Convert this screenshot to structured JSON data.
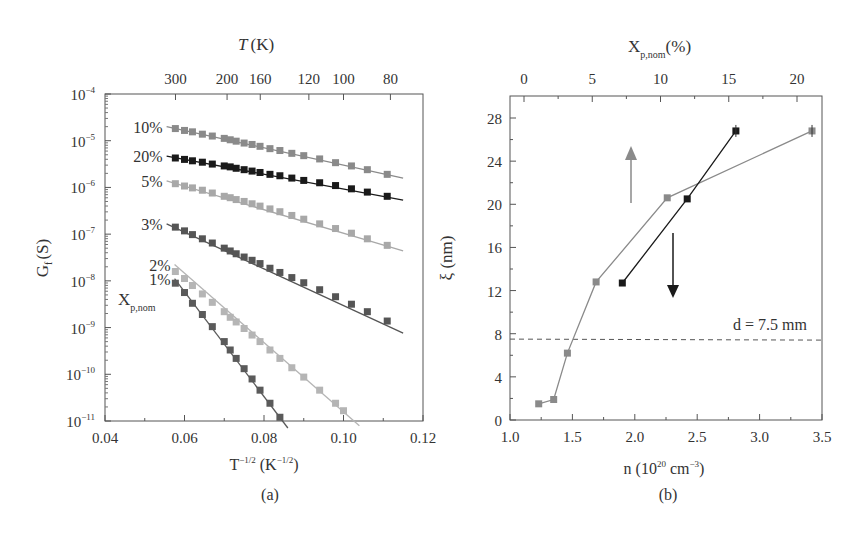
{
  "chart_data": [
    {
      "id": "a",
      "type": "scatter",
      "panel_label": "(a)",
      "title": "",
      "xlabel": "T^-1/2 (K^-1/2)",
      "ylabel": "Gf (S)",
      "top_axis_label": "T (K)",
      "top_axis_ticks": [
        300,
        200,
        160,
        120,
        100,
        80
      ],
      "xlim": [
        0.04,
        0.12
      ],
      "ylim_log10": [
        -11,
        -4
      ],
      "x_ticks": [
        "0.04",
        "0.06",
        "0.08",
        "0.10",
        "0.12"
      ],
      "y_ticks": [
        "10^-4",
        "10^-5",
        "10^-6",
        "10^-7",
        "10^-8",
        "10^-9",
        "10^-10",
        "10^-11"
      ],
      "yscale": "log",
      "grid": false,
      "legend_title": "Xp,nom",
      "series": [
        {
          "name": "10%",
          "color": "#8a8a8a",
          "x": [
            0.0577,
            0.06,
            0.062,
            0.0645,
            0.067,
            0.07,
            0.0715,
            0.073,
            0.075,
            0.077,
            0.079,
            0.0815,
            0.084,
            0.087,
            0.09,
            0.094,
            0.098,
            0.102,
            0.106,
            0.111
          ],
          "log10_y": [
            -4.74,
            -4.78,
            -4.81,
            -4.86,
            -4.9,
            -4.95,
            -4.98,
            -5.01,
            -5.05,
            -5.08,
            -5.12,
            -5.17,
            -5.21,
            -5.27,
            -5.32,
            -5.39,
            -5.47,
            -5.54,
            -5.62,
            -5.72
          ],
          "fit_x": [
            0.0555,
            0.115
          ],
          "fit_log10_y": [
            -4.7,
            -5.8
          ]
        },
        {
          "name": "20%",
          "color": "#1a1a1a",
          "x": [
            0.0577,
            0.06,
            0.062,
            0.0645,
            0.067,
            0.07,
            0.0715,
            0.073,
            0.075,
            0.077,
            0.079,
            0.0815,
            0.084,
            0.087,
            0.09,
            0.094,
            0.098,
            0.102,
            0.106,
            0.111
          ],
          "log10_y": [
            -5.37,
            -5.4,
            -5.43,
            -5.46,
            -5.5,
            -5.54,
            -5.56,
            -5.59,
            -5.62,
            -5.65,
            -5.68,
            -5.72,
            -5.75,
            -5.8,
            -5.85,
            -5.9,
            -5.96,
            -6.03,
            -6.1,
            -6.19
          ],
          "fit_x": [
            0.0555,
            0.115
          ],
          "fit_log10_y": [
            -5.33,
            -6.27
          ]
        },
        {
          "name": "5%",
          "color": "#a8a8a8",
          "x": [
            0.0577,
            0.06,
            0.062,
            0.0645,
            0.067,
            0.07,
            0.0715,
            0.073,
            0.075,
            0.077,
            0.079,
            0.0815,
            0.084,
            0.087,
            0.09,
            0.094,
            0.098,
            0.102,
            0.106,
            0.111
          ],
          "log10_y": [
            -5.92,
            -5.97,
            -6.01,
            -6.06,
            -6.12,
            -6.19,
            -6.22,
            -6.26,
            -6.3,
            -6.35,
            -6.4,
            -6.46,
            -6.52,
            -6.6,
            -6.68,
            -6.78,
            -6.88,
            -6.98,
            -7.1,
            -7.24
          ],
          "fit_x": [
            0.0555,
            0.115
          ],
          "fit_log10_y": [
            -5.86,
            -7.36
          ]
        },
        {
          "name": "3%",
          "color": "#555555",
          "x": [
            0.0577,
            0.06,
            0.062,
            0.0645,
            0.067,
            0.07,
            0.0715,
            0.073,
            0.075,
            0.077,
            0.079,
            0.0815,
            0.084,
            0.087,
            0.09,
            0.094,
            0.098,
            0.102,
            0.106,
            0.111
          ],
          "log10_y": [
            -6.85,
            -6.93,
            -7.01,
            -7.1,
            -7.19,
            -7.3,
            -7.36,
            -7.42,
            -7.49,
            -7.56,
            -7.63,
            -7.73,
            -7.82,
            -7.93,
            -8.04,
            -8.19,
            -8.34,
            -8.5,
            -8.66,
            -8.86
          ],
          "fit_x": [
            0.0555,
            0.115
          ],
          "fit_log10_y": [
            -6.78,
            -9.12
          ]
        },
        {
          "name": "2%",
          "color": "#b5b5b5",
          "x": [
            0.0577,
            0.06,
            0.062,
            0.0645,
            0.067,
            0.07,
            0.0715,
            0.073,
            0.075,
            0.077,
            0.079,
            0.0815,
            0.084,
            0.087,
            0.09,
            0.094,
            0.098,
            0.1
          ],
          "log10_y": [
            -7.8,
            -7.95,
            -8.1,
            -8.28,
            -8.46,
            -8.66,
            -8.78,
            -8.88,
            -9.02,
            -9.16,
            -9.3,
            -9.48,
            -9.66,
            -9.86,
            -10.06,
            -10.34,
            -10.62,
            -10.78
          ],
          "fit_x": [
            0.0575,
            0.104
          ],
          "fit_log10_y": [
            -7.65,
            -11.1
          ]
        },
        {
          "name": "1%",
          "color": "#5a5a5a",
          "x": [
            0.0577,
            0.06,
            0.062,
            0.0645,
            0.067,
            0.07,
            0.0715,
            0.073,
            0.075,
            0.077,
            0.079,
            0.0815,
            0.084
          ],
          "log10_y": [
            -8.05,
            -8.25,
            -8.48,
            -8.72,
            -8.98,
            -9.3,
            -9.48,
            -9.66,
            -9.88,
            -10.1,
            -10.34,
            -10.62,
            -10.92
          ],
          "fit_x": [
            0.0575,
            0.086
          ],
          "fit_log10_y": [
            -7.95,
            -11.15
          ]
        }
      ]
    },
    {
      "id": "b",
      "type": "line",
      "panel_label": "(b)",
      "title": "",
      "xlabel": "n (10^20 cm^-3)",
      "ylabel": "ξ (nm)",
      "top_axis_label": "Xp,nom(%)",
      "top_axis_ticks": [
        "0",
        "5",
        "10",
        "15",
        "20"
      ],
      "xlim": [
        1.0,
        3.5
      ],
      "ylim": [
        0,
        30
      ],
      "x_ticks": [
        "1.0",
        "1.5",
        "2.0",
        "2.5",
        "3.0",
        "3.5"
      ],
      "y_ticks": [
        "0",
        "4",
        "8",
        "12",
        "16",
        "20",
        "24",
        "28"
      ],
      "grid": false,
      "annotations": [
        {
          "text": "d = 7.5 mm",
          "type": "hline",
          "y": 7.5,
          "style": "dashed"
        },
        {
          "type": "arrow",
          "direction": "up",
          "color": "#8a8a8a"
        },
        {
          "type": "arrow",
          "direction": "down",
          "color": "#1a1a1a"
        }
      ],
      "series": [
        {
          "name": "gray (bottom axis, n)",
          "color": "#8a8a8a",
          "x": [
            1.23,
            1.35,
            1.46,
            1.69,
            2.26,
            3.42
          ],
          "y": [
            1.5,
            1.9,
            6.2,
            12.8,
            20.6,
            26.8
          ]
        },
        {
          "name": "black (top axis, Xp,nom)",
          "color": "#1a1a1a",
          "x": [
            1.9,
            2.42,
            2.81
          ],
          "y": [
            12.7,
            20.5,
            26.8
          ],
          "top_x_percent": [
            7.5,
            12,
            15
          ]
        }
      ]
    }
  ],
  "labels": {
    "a_ylabel": "G",
    "a_ylabel_sub": "f",
    "a_ylabel_unit": "(S)",
    "a_top_T": "T",
    "a_top_unit": "(K)",
    "a_xlabel_main": "T",
    "a_xlabel_sup": "−1/2",
    "a_xlabel_unit_open": "(K",
    "a_xlabel_unit_sup": "−1/2",
    "a_xlabel_unit_close": ")",
    "a_legend_X": "X",
    "a_legend_sub": "p,nom",
    "a_panel": "(a)",
    "b_ylabel": "ξ (nm)",
    "b_top_X": "X",
    "b_top_sub": "p,nom",
    "b_top_unit": "(%)",
    "b_xlabel_main": "n (10",
    "b_xlabel_sup1": "20",
    "b_xlabel_mid": " cm",
    "b_xlabel_sup2": "−3",
    "b_xlabel_close": ")",
    "b_hline": "d = 7.5 mm",
    "b_panel": "(b)"
  }
}
